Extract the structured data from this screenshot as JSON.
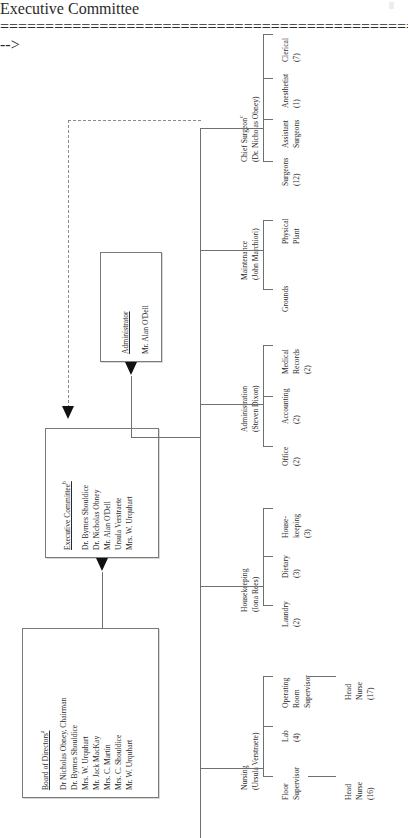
{
  "document": {
    "title": "Shouldice Hospital Organization Chart",
    "orientation": "rotated-90-ccw"
  },
  "boxes": {
    "board": {
      "header": "Board of Directors",
      "superscript": "a",
      "members": [
        "Dr Nicholas Obney, Chairman",
        "Dr. Byrnes Shouldice",
        "Mrs. W. Urquhart",
        "Mr. Jack MacKay",
        "Mrs. C. Martin",
        "Mrs. C. Shouldice",
        "Mr. W. Urquhart"
      ]
    },
    "executive_committee": {
      "header": "Executive Committee",
      "superscript": "b",
      "members": [
        "Dr. Byrnes Shouldice",
        "Dr. Nicholas Obney",
        "Mr. Alan O'Dell",
        "Ursula Verstraete",
        "Mrs. W. Urquhart"
      ]
    },
    "administrator": {
      "header": "Administrator",
      "name": "Mr. Alan O'Dell"
    }
  },
  "departments": [
    {
      "key": "nursing",
      "title": "Nursing",
      "manager": "(Ursula Verstraete)",
      "children": [
        {
          "label_line1": "Floor",
          "label_line2": "Supervisor",
          "count": ""
        },
        {
          "label_line1": "Lab",
          "label_line2": "",
          "count": "(4)"
        },
        {
          "label_line1": "Operating",
          "label_line2": "Room",
          "label_line3": "Supervisor",
          "count": ""
        }
      ],
      "grandchildren": [
        {
          "parent": "Floor Supervisor",
          "label_line1": "Head",
          "label_line2": "Nurse",
          "count": "(16)"
        },
        {
          "parent": "Operating Room Supervisor",
          "label_line1": "Head",
          "label_line2": "Nurse",
          "count": "(17)"
        }
      ]
    },
    {
      "key": "housekeeping",
      "title": "Housekeeping",
      "manager": "(Iona Rees)",
      "children": [
        {
          "label_line1": "Laundry",
          "label_line2": "",
          "count": "(2)"
        },
        {
          "label_line1": "Dietary",
          "label_line2": "",
          "count": "(3)"
        },
        {
          "label_line1": "House-",
          "label_line2": "keeping",
          "count": "(3)"
        }
      ],
      "grandchildren": []
    },
    {
      "key": "administration",
      "title": "Administration",
      "manager": "(Steven Dixon)",
      "children": [
        {
          "label_line1": "Office",
          "label_line2": "",
          "count": "(2)"
        },
        {
          "label_line1": "Accounting",
          "label_line2": "",
          "count": "(2)"
        },
        {
          "label_line1": "Medical",
          "label_line2": "Records",
          "count": "(2)"
        }
      ],
      "grandchildren": []
    },
    {
      "key": "maintenance",
      "title": "Maintenance",
      "manager": "(John Marchiori)",
      "children": [
        {
          "label_line1": "Grounds",
          "label_line2": "",
          "count": ""
        },
        {
          "label_line1": "Physical",
          "label_line2": "Plant",
          "count": ""
        }
      ],
      "grandchildren": []
    },
    {
      "key": "chief_surgeon",
      "title": "Chief Surgeon",
      "superscript": "c",
      "manager": "(Dr. Nicholas Obney)",
      "children": [
        {
          "label_line1": "Surgeons",
          "label_line2": "",
          "count": "(12)"
        },
        {
          "label_line1": "Assistant",
          "label_line2": "Surgeons",
          "count": ""
        },
        {
          "label_line1": "Anesthetist",
          "label_line2": "",
          "count": "(1)"
        },
        {
          "label_line1": "Clerical",
          "label_line2": "",
          "count": "(7)"
        }
      ],
      "grandchildren": []
    }
  ],
  "connectors": {
    "board_to_executive": "solid-arrow",
    "executive_to_administrator": "solid-arrow",
    "chief_surgeon_to_executive": "dashed-arrow"
  },
  "colors": {
    "line": "#8c8c8c",
    "arrow": "#111111",
    "box_border": "#7a7a7a",
    "text": "#2b2b2b",
    "background": "#ffffff"
  }
}
